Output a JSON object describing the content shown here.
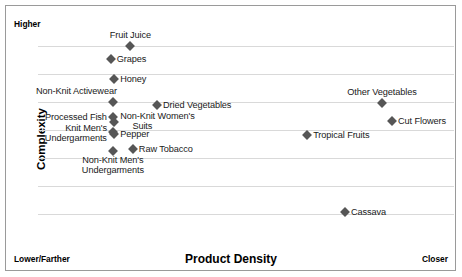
{
  "chart_data": {
    "type": "scatter",
    "title": "",
    "xlabel": "Product Density",
    "ylabel": "Complexity",
    "xlim": [
      0,
      100
    ],
    "ylim": [
      0,
      100
    ],
    "grid": true,
    "legend_position": "none",
    "axis_endpoint_labels": {
      "y_top": "Higher",
      "x_left": "Lower/Farther",
      "x_right": "Closer"
    },
    "marker_color": "#565656",
    "gridline_color": "#d9d9d9",
    "points": [
      {
        "label": "Fruit Juice",
        "x": 22.2,
        "y": 86.7,
        "label_pos": "above"
      },
      {
        "label": "Grapes",
        "x": 17.5,
        "y": 81.0,
        "label_pos": "right"
      },
      {
        "label": "Honey",
        "x": 18.3,
        "y": 72.1,
        "label_pos": "right"
      },
      {
        "label": "Non-Knit Activewear",
        "x": 18.0,
        "y": 62.0,
        "label_pos": "above-left"
      },
      {
        "label": "Dried Vegetables",
        "x": 28.6,
        "y": 60.6,
        "label_pos": "right"
      },
      {
        "label": "Processed Fish",
        "x": 18.0,
        "y": 55.3,
        "label_pos": "left"
      },
      {
        "label": "Non-Knit Women's Suits",
        "x": 18.3,
        "y": 53.1,
        "label_pos": "right"
      },
      {
        "label": "Knit Men's Undergarments",
        "x": 18.0,
        "y": 48.7,
        "label_pos": "left"
      },
      {
        "label": "Pepper",
        "x": 18.3,
        "y": 47.8,
        "label_pos": "right"
      },
      {
        "label": "Raw Tobacco",
        "x": 22.8,
        "y": 41.2,
        "label_pos": "right"
      },
      {
        "label": "Non-Knit Men's Undergarments",
        "x": 18.0,
        "y": 40.3,
        "label_pos": "below"
      },
      {
        "label": "Other Vegetables",
        "x": 82.7,
        "y": 61.5,
        "label_pos": "above"
      },
      {
        "label": "Cut Flowers",
        "x": 85.1,
        "y": 53.5,
        "label_pos": "right"
      },
      {
        "label": "Tropical Fruits",
        "x": 64.7,
        "y": 47.3,
        "label_pos": "right"
      },
      {
        "label": "Cassava",
        "x": 73.8,
        "y": 13.3,
        "label_pos": "right"
      }
    ],
    "gridline_y_values": [
      86.7,
      74.3,
      62.0,
      49.6,
      37.2,
      24.8,
      12.4
    ]
  }
}
